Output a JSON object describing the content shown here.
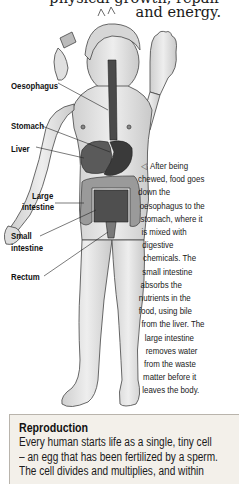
{
  "intro": {
    "line1": "physical growth, repair",
    "line2": "and energy."
  },
  "figure": {
    "labels": {
      "oesophagus": "Oesophagus",
      "stomach": "Stomach",
      "liver": "Liver",
      "large_intestine_1": "Large",
      "large_intestine_2": "intestine",
      "small_intestine_1": "Small",
      "small_intestine_2": "intestine",
      "rectum": "Rectum"
    }
  },
  "caption": {
    "arrow_icon": "◁",
    "lines": [
      "After being",
      "chewed, food goes",
      "down the",
      "oesophagus to the",
      "stomach, where it",
      "is mixed with",
      "digestive",
      "chemicals. The",
      "small intestine",
      "absorbs the",
      "nutrients in the",
      "food, using bile",
      "from the liver. The",
      "large intestine",
      "removes water",
      "from the waste",
      "matter before it",
      "leaves the body."
    ]
  },
  "reproduction": {
    "title": "Reproduction",
    "lines": [
      "Every human starts life as a single, tiny cell",
      "– an egg that has been fertilized by a sperm.",
      "The cell divides and multiplies, and within"
    ]
  },
  "colors": {
    "box_background": "#f3f0ea",
    "box_border": "#b9b4ac",
    "organ_dark": "#3c3c3c",
    "skin": "#e6e6e6"
  }
}
